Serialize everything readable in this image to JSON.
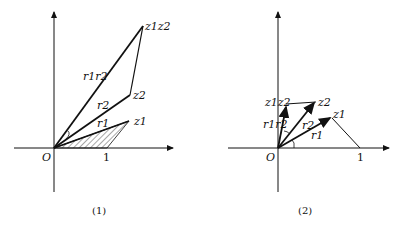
{
  "figure1": {
    "caption": "(1)",
    "origin_label": "O",
    "unit_label": "1",
    "points": {
      "z1": "z1",
      "z2": "z2",
      "z1z2": "z1z2"
    },
    "segment_labels": {
      "r1": "r1",
      "r2": "r2",
      "r1r2": "r1r2"
    },
    "shaded_triangle": "O-1-z1"
  },
  "figure2": {
    "caption": "(2)",
    "origin_label": "O",
    "unit_label": "1",
    "points": {
      "z1": "z1",
      "z2": "z2",
      "z1z2": "z1z2"
    },
    "segment_labels": {
      "r1": "r1",
      "r2": "r2",
      "r1r2": "r1r2"
    }
  },
  "colors": {
    "ink": "#111111",
    "background": "#ffffff"
  }
}
